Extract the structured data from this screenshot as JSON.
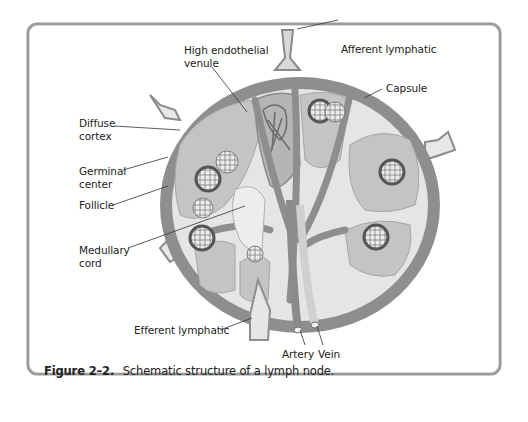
{
  "figure": {
    "caption_number": "Figure 2–2.",
    "caption_text": "Schematic structure of a lymph node."
  },
  "labels": {
    "high_endothelial_venule": "High endothelial\nvenule",
    "afferent_lymphatic": "Afferent lymphatic",
    "capsule": "Capsule",
    "diffuse_cortex": "Diffuse\ncortex",
    "germinal_center": "Germinal\ncenter",
    "follicle": "Follicle",
    "medullary_cord": "Medullary\ncord",
    "efferent_lymphatic": "Efferent lymphatic",
    "artery": "Artery",
    "vein": "Vein"
  },
  "colors": {
    "frame_border": "#8a8a8a",
    "capsule": "#8c8c8c",
    "cortex": "#c6c6c6",
    "sinus": "#e6e6e6",
    "follicle": "#bdbdbd",
    "background": "#ffffff"
  }
}
